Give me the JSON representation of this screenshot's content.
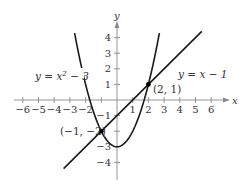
{
  "chart_data": {
    "type": "line",
    "title": "",
    "xlabel": "x",
    "ylabel": "y",
    "xlim": [
      -6.5,
      7
    ],
    "ylim": [
      -5,
      4.8
    ],
    "grid": false,
    "x_ticks": [
      -6,
      -5,
      -4,
      -3,
      -2,
      -1,
      1,
      2,
      3,
      4,
      5,
      6
    ],
    "x_tick_labels": [
      "−6",
      "−5",
      "−4",
      "−3",
      "−2",
      "",
      "1",
      "2",
      "3",
      "4",
      "5",
      "6"
    ],
    "y_ticks": [
      4,
      3,
      2,
      1,
      -1,
      -2,
      -3,
      -4
    ],
    "y_tick_labels": [
      "4",
      "3",
      "2",
      "1",
      "−1",
      "",
      "−3",
      "−4"
    ],
    "series": [
      {
        "name": "y = x² − 3",
        "label": "y = x",
        "label_sup": "2",
        "label_tail": " − 3",
        "equation": "x^2 - 3",
        "x_range": [
          -2.7,
          2.7
        ],
        "sample_points": [
          [
            -2.7,
            4.29
          ],
          [
            -2,
            1
          ],
          [
            -1,
            -2
          ],
          [
            0,
            -3
          ],
          [
            1,
            -2
          ],
          [
            2,
            1
          ],
          [
            2.7,
            4.29
          ]
        ]
      },
      {
        "name": "y = x − 1",
        "label": "y = x − 1",
        "equation": "x - 1",
        "x_range": [
          -3.4,
          5.4
        ],
        "sample_points": [
          [
            -3.4,
            -4.4
          ],
          [
            0,
            -1
          ],
          [
            2,
            1
          ],
          [
            5.4,
            4.4
          ]
        ]
      }
    ],
    "annotations": [
      {
        "point": [
          2,
          1
        ],
        "label": "(2, 1)"
      },
      {
        "point": [
          -1,
          -2
        ],
        "label": "(−1, −2)"
      }
    ]
  },
  "labels": {
    "x_axis": "x",
    "y_axis": "y",
    "parabola_eq_main": "y = x",
    "parabola_eq_sup": "2",
    "parabola_eq_tail": " − 3",
    "line_eq": "y = x − 1",
    "point_a": "(2, 1)",
    "point_b": "(−1, −2)"
  },
  "colors": {
    "curve": "#1a1a1a",
    "axis": "#8a8a8a",
    "text": "#333333"
  }
}
